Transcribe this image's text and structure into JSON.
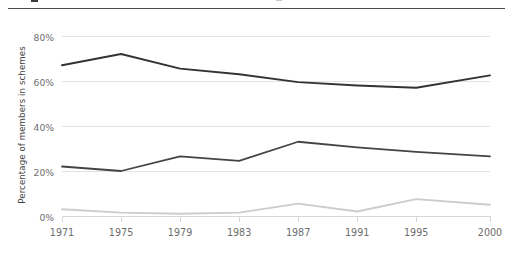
{
  "chart_data": {
    "type": "line",
    "title": "",
    "xlabel": "",
    "ylabel": "Percentage of members in schemes",
    "x": [
      1971,
      1975,
      1979,
      1983,
      1987,
      1991,
      1995,
      2000
    ],
    "categories": [
      "1971",
      "1975",
      "1979",
      "1983",
      "1987",
      "1991",
      "1995",
      "2000"
    ],
    "ylim": [
      0,
      80
    ],
    "yticks": [
      0,
      20,
      40,
      60,
      80
    ],
    "ytick_labels": [
      "0%",
      "20%",
      "40%",
      "60%",
      "80%"
    ],
    "grid": true,
    "legend": "none",
    "series": [
      {
        "name": "series-top",
        "color": "#333333",
        "width": 1.9,
        "values": [
          67,
          72,
          65.5,
          63,
          59.5,
          58,
          57,
          62.5
        ]
      },
      {
        "name": "series-middle",
        "color": "#444444",
        "width": 1.8,
        "values": [
          22,
          20,
          26.5,
          24.5,
          33,
          30.5,
          28.5,
          26.5
        ]
      },
      {
        "name": "series-bottom",
        "color": "#cccccc",
        "width": 2.0,
        "values": [
          3,
          1.5,
          1,
          1.5,
          5.5,
          2,
          7.5,
          5
        ]
      }
    ]
  },
  "axis": {
    "y_title": "Percentage of members in schemes",
    "y_labels": [
      "80%",
      "60%",
      "40%",
      "20%",
      "0%"
    ],
    "x_labels": [
      "1971",
      "1975",
      "1979",
      "1983",
      "1987",
      "1991",
      "1995",
      "2000"
    ]
  },
  "colors": {
    "dark_line": "#333333",
    "mid_line": "#444444",
    "light_line": "#cccccc",
    "gridline": "#e3e3e3",
    "axis_text": "#6d6d6d",
    "header_rule": "#4a4a4a",
    "background": "#ffffff"
  }
}
